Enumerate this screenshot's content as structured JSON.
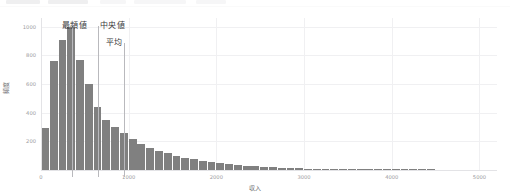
{
  "toolbar": {
    "visible_fragment": true,
    "chips": [
      {
        "label": "",
        "x": 6,
        "w": 34
      },
      {
        "label": "",
        "x": 48,
        "w": 40
      },
      {
        "label": "",
        "x": 100,
        "w": 26
      },
      {
        "label": "",
        "x": 134,
        "w": 52
      },
      {
        "label": "",
        "x": 196,
        "w": 30
      }
    ]
  },
  "chart_data": {
    "type": "bar",
    "title": "",
    "subtitle": "",
    "xlabel": "収入",
    "ylabel": "頻度",
    "xlim": [
      0,
      5200
    ],
    "ylim": [
      0,
      1060
    ],
    "grid": true,
    "legend": false,
    "legend_position": "none",
    "bar_color": "#808080",
    "xticks": [
      0,
      1000,
      2000,
      3000,
      4000,
      5000
    ],
    "xtick_labels": [
      "0",
      "1000",
      "2000",
      "3000",
      "4000",
      "5000"
    ],
    "yticks": [
      200,
      400,
      600,
      800,
      1000
    ],
    "ytick_labels": [
      "200",
      "400",
      "600",
      "800",
      "1000"
    ],
    "bin_width": 100,
    "categories": [
      "0-100",
      "100-200",
      "200-300",
      "300-400",
      "400-500",
      "500-600",
      "600-700",
      "700-800",
      "800-900",
      "900-1000",
      "1000-1100",
      "1100-1200",
      "1200-1300",
      "1300-1400",
      "1400-1500",
      "1500-1600",
      "1600-1700",
      "1700-1800",
      "1800-1900",
      "1900-2000",
      "2000-2100",
      "2100-2200",
      "2200-2300",
      "2300-2400",
      "2400-2500",
      "2500-2600",
      "2600-2700",
      "2700-2800",
      "2800-2900",
      "2900-3000",
      "3000-3100",
      "3100-3200",
      "3200-3300",
      "3300-3400",
      "3400-3500",
      "3500-3600",
      "3600-3700",
      "3700-3800",
      "3800-3900",
      "3900-4000",
      "4000-4100",
      "4100-4200",
      "4200-4300",
      "4300-4400",
      "4400-4500"
    ],
    "values": [
      290,
      760,
      905,
      1000,
      770,
      600,
      440,
      350,
      300,
      255,
      215,
      180,
      155,
      135,
      118,
      100,
      86,
      74,
      62,
      54,
      46,
      40,
      34,
      29,
      25,
      21,
      18,
      15,
      13,
      11,
      10,
      9,
      8,
      7,
      6,
      6,
      5,
      5,
      4,
      4,
      3,
      3,
      3,
      2,
      2
    ],
    "annotations": [
      {
        "name": "mode",
        "label": "最頻値",
        "x_value": 350,
        "label_x": 62,
        "label_y": 12,
        "line_top": 19,
        "line_bottom": 170
      },
      {
        "name": "median",
        "label": "中央値",
        "x_value": 650,
        "label_x": 100,
        "label_y": 12,
        "line_top": 19,
        "line_bottom": 170
      },
      {
        "name": "mean",
        "label": "平均",
        "x_value": 950,
        "label_x": 106,
        "label_y": 29,
        "line_top": 36,
        "line_bottom": 170
      }
    ]
  }
}
